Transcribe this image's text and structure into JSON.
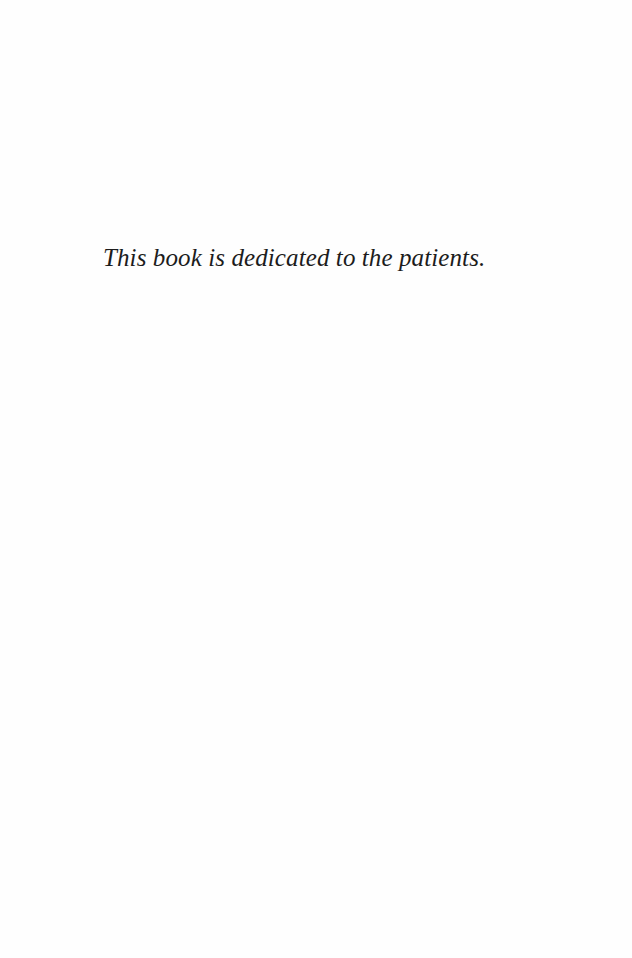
{
  "page": {
    "type": "dedication",
    "background_color": "#fefefe",
    "text_color": "#1c1c1c"
  },
  "dedication": {
    "text": "This book is dedicated to the patients."
  }
}
